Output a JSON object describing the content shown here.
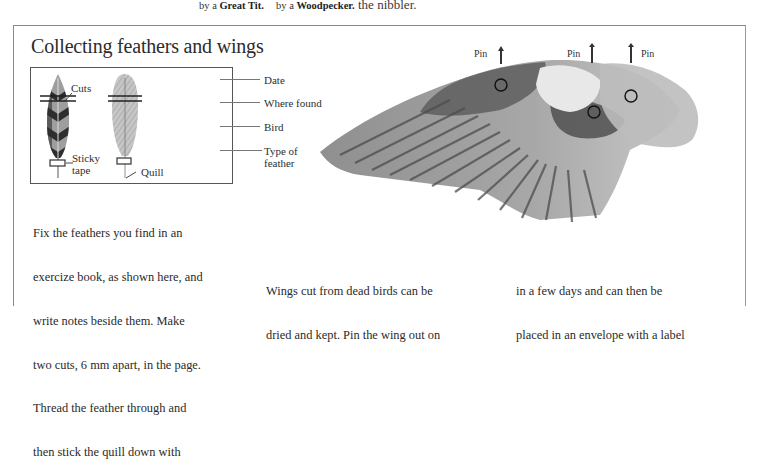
{
  "top_captions": {
    "great_tit": {
      "prefix": "by a",
      "bird": "Great Tit."
    },
    "woodpecker": {
      "prefix": "by a",
      "bird": "Woodpecker."
    },
    "nibbler": "the nibbler."
  },
  "section": {
    "title": "Collecting feathers and wings"
  },
  "feather_diagram": {
    "labels": {
      "cuts": "Cuts",
      "sticky_tape_line1": "Sticky",
      "sticky_tape_line2": "tape",
      "quill": "Quill"
    },
    "notes": [
      {
        "label": "Date"
      },
      {
        "label": "Where found"
      },
      {
        "label": "Bird"
      },
      {
        "label_line1": "Type of",
        "label_line2": "feather"
      }
    ]
  },
  "wing_diagram": {
    "pins": [
      "Pin",
      "Pin",
      "Pin"
    ]
  },
  "body_text": {
    "column1": [
      "Fix the feathers you find in an",
      "exercize book, as shown here, and",
      "write notes beside them. Make",
      "two cuts, 6 mm apart, in the page.",
      "Thread the feather through and",
      "then stick the quill down with"
    ],
    "column2": [
      "Wings cut from dead birds can be",
      "dried and kept. Pin the wing out on"
    ],
    "column3": [
      "in a few days and can then be",
      "placed in an envelope with a label"
    ]
  },
  "colors": {
    "ink": "#2a2a2a",
    "frame": "#8a8a8a",
    "feather_dark": "#3a3a3a",
    "feather_light": "#b8b8b8"
  }
}
